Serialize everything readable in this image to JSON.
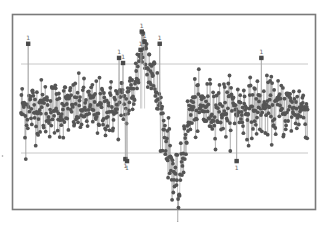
{
  "chart_data": {
    "type": "line",
    "subtype": "individuals control chart",
    "title": "",
    "xlabel": "",
    "ylabel": "",
    "grid": false,
    "legend": null,
    "n_points": 720,
    "xlim": [
      0,
      720
    ],
    "ylim": [
      0,
      100
    ],
    "center_line": 55,
    "ucl": 77,
    "lcl": 33,
    "noise_sd": 7,
    "profile": [
      {
        "x": 0,
        "y": 55
      },
      {
        "x": 240,
        "y": 55
      },
      {
        "x": 280,
        "y": 62
      },
      {
        "x": 305,
        "y": 86
      },
      {
        "x": 320,
        "y": 80
      },
      {
        "x": 345,
        "y": 58
      },
      {
        "x": 375,
        "y": 30
      },
      {
        "x": 395,
        "y": 10
      },
      {
        "x": 410,
        "y": 40
      },
      {
        "x": 430,
        "y": 55
      },
      {
        "x": 720,
        "y": 55
      }
    ],
    "out_of_control_points": [
      {
        "x": 18,
        "y": 87,
        "label": "1"
      },
      {
        "x": 246,
        "y": 80,
        "label": "1"
      },
      {
        "x": 256,
        "y": 77.5,
        "label": "1"
      },
      {
        "x": 303,
        "y": 93,
        "label": "1"
      },
      {
        "x": 310,
        "y": 88,
        "label": "1"
      },
      {
        "x": 300,
        "y": 84,
        "label": "1"
      },
      {
        "x": 348,
        "y": 87,
        "label": "1"
      },
      {
        "x": 262,
        "y": 30,
        "label": "1"
      },
      {
        "x": 266,
        "y": 29,
        "label": "1"
      },
      {
        "x": 603,
        "y": 80,
        "label": "1"
      },
      {
        "x": 541,
        "y": 29,
        "label": "1"
      },
      {
        "x": 12,
        "y": 30,
        "label": ""
      }
    ],
    "colors": {
      "points": "#555555",
      "connector": "#9a9a9a",
      "limits": "#c8c8c8",
      "frame": "#7a7a7a",
      "label": "#666666"
    }
  }
}
